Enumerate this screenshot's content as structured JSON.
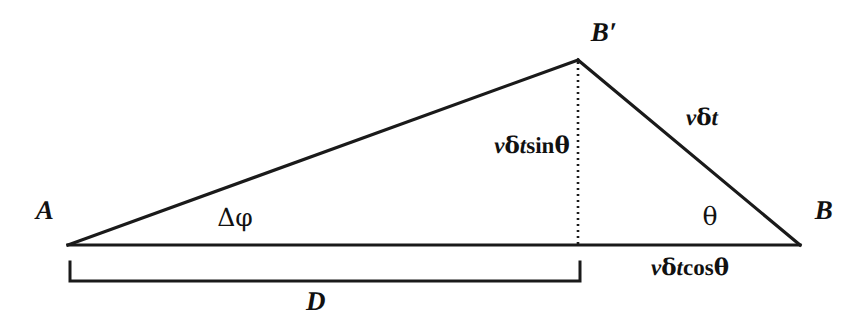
{
  "figure": {
    "name": "velocity-resolution-triangle",
    "background_color": "#ffffff",
    "stroke_color": "#1a1a1a",
    "text_color": "#111111",
    "width": 861,
    "height": 328
  },
  "labels": {
    "vertex_a": "A",
    "vertex_b": "B",
    "vertex_b_prime": "B′",
    "angle_delta_phi": "Δφ",
    "angle_theta": "θ",
    "baseline_bracket": "D",
    "hypotenuse_right": {
      "v": "v",
      "delta": "δ",
      "t": "t"
    },
    "vertical_dotted": {
      "v": "v",
      "delta": "δ",
      "t": "t",
      "fn": "sin",
      "theta": "θ"
    },
    "horizontal_component": {
      "v": "v",
      "delta": "δ",
      "t": "t",
      "fn": "cos",
      "theta": "θ"
    }
  },
  "geometry": {
    "point_a": {
      "x": 68,
      "y": 245
    },
    "point_b": {
      "x": 800,
      "y": 245
    },
    "point_b_prime": {
      "x": 578,
      "y": 60
    },
    "foot_of_perpendicular": {
      "x": 578,
      "y": 245
    },
    "bracket": {
      "left_x": 70,
      "right_x": 580,
      "top_y": 262,
      "bottom_y": 283
    },
    "stroke_width_solid": 3.2,
    "stroke_width_bracket": 3,
    "dotted_dash_pattern": "2 4"
  },
  "label_positions": {
    "vertex_a": {
      "x": 45,
      "y": 210
    },
    "vertex_b": {
      "x": 824,
      "y": 210
    },
    "vertex_b_prime": {
      "x": 604,
      "y": 32
    },
    "angle_delta_phi": {
      "x": 235,
      "y": 217
    },
    "angle_theta": {
      "x": 710,
      "y": 216
    },
    "baseline_bracket": {
      "x": 316,
      "y": 301
    },
    "hypotenuse_right": {
      "x": 702,
      "y": 117
    },
    "vertical_dotted": {
      "x": 532,
      "y": 145
    },
    "horizontal_component": {
      "x": 690,
      "y": 267
    }
  }
}
